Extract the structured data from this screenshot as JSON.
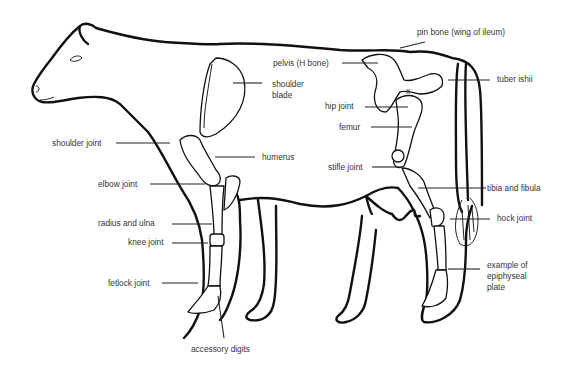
{
  "diagram": {
    "labels": {
      "pin_bone": "pin bone (wing of ileum)",
      "pelvis": "pelvis (H bone)",
      "shoulder_blade": "shoulder\nblade",
      "tuber_ishii": "tuber ishii",
      "hip_joint": "hip joint",
      "x_mark": "x",
      "femur": "femur",
      "shoulder_joint": "shoulder joint",
      "humerus": "humerus",
      "stifle_joint": "stifle joint",
      "elbow_joint": "elbow joint",
      "tibia_fibula": "tibia and fibula",
      "radius_ulna": "radius and ulna",
      "hock_joint": "hock joint",
      "knee_joint": "knee joint",
      "epiphyseal_plate": "example of\nepiphyseal\nplate",
      "fetlock_joint": "fetlock joint",
      "accessory_digits": "accessory digits"
    }
  }
}
